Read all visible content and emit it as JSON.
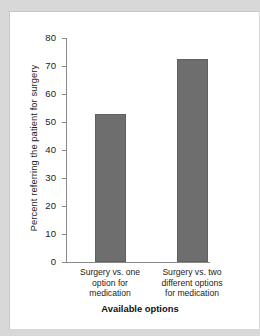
{
  "chart_data": {
    "type": "bar",
    "title": "",
    "categories": [
      "Surgery vs. one option for medication",
      "Surgery vs. two different options for medication"
    ],
    "category_lines": [
      [
        "Surgery vs. one",
        "option for",
        "medication"
      ],
      [
        "Surgery vs. two",
        "different options",
        "for medication"
      ]
    ],
    "values": [
      53,
      72.5
    ],
    "xlabel": "Available options",
    "ylabel": "Percent referring the patient for surgery",
    "ylim": [
      0,
      80
    ],
    "yticks": [
      0,
      10,
      20,
      30,
      40,
      50,
      60,
      70,
      80
    ],
    "ytick_labels": [
      "0",
      "10",
      "20",
      "30",
      "40",
      "50",
      "60",
      "70",
      "80"
    ],
    "grid": false,
    "legend": null,
    "bar_color": "#6e6e6e",
    "axis_color": "#8a8a8a",
    "background": "#ffffff",
    "page_background": "#d8d8d8"
  }
}
